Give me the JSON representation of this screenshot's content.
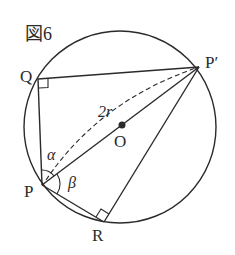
{
  "figure": {
    "title": "図6",
    "labels": {
      "Q": "Q",
      "P_prime": "P′",
      "P": "P",
      "R": "R",
      "O": "O",
      "diameter": "2r",
      "alpha": "α",
      "beta": "β"
    },
    "elements": [
      "circle-center-O",
      "diameter-P-Pprime",
      "dashed-arc-2r",
      "chord-Q-Pprime",
      "chord-P-Q",
      "chord-P-R",
      "chord-R-Pprime",
      "right-angle-at-Q",
      "right-angle-at-R",
      "angle-alpha-at-P",
      "angle-beta-at-P"
    ],
    "colors": {
      "ink": "#2a2a2a",
      "background": "#ffffff"
    }
  }
}
